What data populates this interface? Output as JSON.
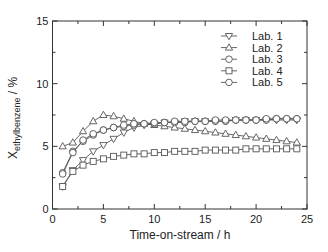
{
  "chart_data": {
    "type": "line",
    "title": "",
    "xlabel": "Time-on-stream / h",
    "ylabel_main": "X",
    "ylabel_sub": "ethylbenzene",
    "ylabel_unit": " / %",
    "xlim": [
      0,
      25
    ],
    "ylim": [
      0,
      15
    ],
    "xticks": [
      0,
      5,
      10,
      15,
      20,
      25
    ],
    "yticks": [
      0,
      5,
      10,
      15
    ],
    "grid": false,
    "legend_position": "upper right",
    "x": [
      1,
      2,
      3,
      4,
      5,
      6,
      7,
      8,
      9,
      10,
      11,
      12,
      13,
      14,
      15,
      16,
      17,
      18,
      19,
      20,
      21,
      22,
      23,
      24
    ],
    "series": [
      {
        "name": "Lab. 1",
        "marker": "triangle-down",
        "values": [
          1.8,
          3.1,
          3.9,
          4.6,
          5.1,
          5.6,
          6.1,
          6.5,
          6.7,
          6.8,
          6.9,
          6.9,
          7.0,
          7.0,
          7.0,
          7.0,
          7.0,
          7.1,
          7.1,
          7.1,
          7.1,
          7.1,
          7.1,
          7.1
        ]
      },
      {
        "name": "Lab. 2",
        "marker": "triangle-up",
        "values": [
          5.0,
          5.3,
          6.2,
          7.0,
          7.5,
          7.4,
          7.2,
          7.0,
          6.8,
          6.7,
          6.6,
          6.5,
          6.4,
          6.3,
          6.2,
          6.1,
          6.0,
          5.9,
          5.8,
          5.7,
          5.6,
          5.5,
          5.4,
          5.3
        ]
      },
      {
        "name": "Lab. 3",
        "marker": "circle",
        "values": [
          2.9,
          4.6,
          5.4,
          5.9,
          6.3,
          6.5,
          6.6,
          6.7,
          6.8,
          6.8,
          6.9,
          6.9,
          6.9,
          7.0,
          7.0,
          7.0,
          7.0,
          7.1,
          7.1,
          7.1,
          7.1,
          7.2,
          7.2,
          7.2
        ]
      },
      {
        "name": "Lab. 4",
        "marker": "square",
        "values": [
          1.8,
          3.0,
          3.5,
          3.8,
          4.0,
          4.2,
          4.3,
          4.4,
          4.4,
          4.5,
          4.5,
          4.6,
          4.6,
          4.6,
          4.7,
          4.7,
          4.7,
          4.7,
          4.8,
          4.8,
          4.8,
          4.8,
          4.8,
          4.8
        ]
      },
      {
        "name": "Lab. 5",
        "marker": "circle",
        "values": [
          2.8,
          4.5,
          5.5,
          6.0,
          6.3,
          6.5,
          6.7,
          6.8,
          6.8,
          6.9,
          6.9,
          7.0,
          7.0,
          7.0,
          7.0,
          7.1,
          7.1,
          7.1,
          7.1,
          7.1,
          7.2,
          7.2,
          7.2,
          7.2
        ]
      }
    ]
  },
  "colors": {
    "line": "#555555",
    "axis": "#333333",
    "marker_fill": "#ffffff"
  }
}
